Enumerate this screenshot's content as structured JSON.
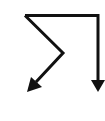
{
  "icon": {
    "name": "split-route-arrows-icon",
    "description": "Line path splitting into two downward arrows",
    "stroke_color": "#111111",
    "background": "#ffffff"
  }
}
